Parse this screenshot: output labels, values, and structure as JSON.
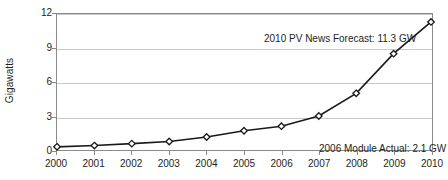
{
  "chart_data": {
    "type": "line",
    "title": "",
    "subtitle": "",
    "xlabel": "",
    "ylabel": "Gigawatts",
    "categories": [
      "2000",
      "2001",
      "2002",
      "2003",
      "2004",
      "2005",
      "2006",
      "2007",
      "2008",
      "2009",
      "2010"
    ],
    "x": [
      2000,
      2001,
      2002,
      2003,
      2004,
      2005,
      2006,
      2007,
      2008,
      2009,
      2010
    ],
    "values": [
      0.28,
      0.39,
      0.56,
      0.75,
      1.15,
      1.7,
      2.1,
      3.0,
      5.0,
      8.5,
      11.3
    ],
    "series": [
      {
        "name": "PV module shipments",
        "values": [
          0.28,
          0.39,
          0.56,
          0.75,
          1.15,
          1.7,
          2.1,
          3.0,
          5.0,
          8.5,
          11.3
        ],
        "color": "#1a1a1a",
        "marker": "diamond"
      }
    ],
    "ylim": [
      0,
      12
    ],
    "yticks": [
      0,
      3,
      6,
      9,
      12
    ],
    "ytick_labels": [
      "0",
      "3",
      "6",
      "9",
      "12"
    ],
    "xlim": [
      2000,
      2010
    ],
    "grid": "horizontal",
    "grid_color": "#c9c9c9",
    "legend": "none",
    "frame_color": "#8a8a8a",
    "annotations": [
      {
        "id": "forecast",
        "text": "2010 PV News Forecast: 11.3 GW",
        "value": 11.3,
        "year": 2010
      },
      {
        "id": "actual",
        "text": "2006 Module Actual: 2.1 GW",
        "value": 2.1,
        "year": 2006
      }
    ]
  }
}
